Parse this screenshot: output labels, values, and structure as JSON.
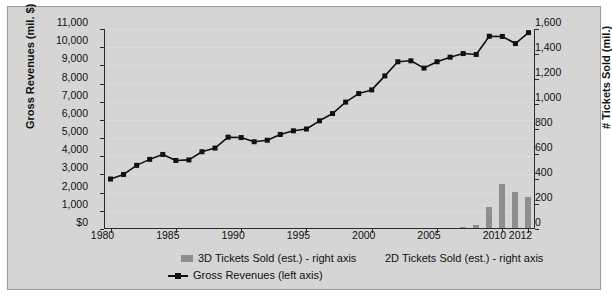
{
  "chart_data": {
    "type": "line",
    "title": "",
    "subtitle": "",
    "xlabel": "",
    "ylabel": "Gross Revenues (mil. $)",
    "y2label": "# Tickets Sold (mil.)",
    "grid": true,
    "legend_position": "bottom",
    "x": [
      1980,
      1981,
      1982,
      1983,
      1984,
      1985,
      1986,
      1987,
      1988,
      1989,
      1990,
      1991,
      1992,
      1993,
      1994,
      1995,
      1996,
      1997,
      1998,
      1999,
      2000,
      2001,
      2002,
      2003,
      2004,
      2005,
      2006,
      2007,
      2008,
      2009,
      2010,
      2011,
      2012
    ],
    "xlim": [
      1979.5,
      2012.5
    ],
    "xticks": [
      1980,
      1985,
      1990,
      1995,
      2000,
      2005,
      2010,
      2012
    ],
    "xticklabels": [
      "1980",
      "1985",
      "1990",
      "1995",
      "2000",
      "2005",
      "2010",
      "2012"
    ],
    "ylim": [
      0,
      11000
    ],
    "yticks": [
      0,
      1000,
      2000,
      3000,
      4000,
      5000,
      6000,
      7000,
      8000,
      9000,
      10000,
      11000
    ],
    "yticklabels": [
      "$0",
      "1,000",
      "2,000",
      "3,000",
      "4,000",
      "5,000",
      "6,000",
      "7,000",
      "8,000",
      "9,000",
      "10,000",
      "11,000"
    ],
    "y2lim": [
      0,
      1600
    ],
    "y2ticks": [
      0,
      200,
      400,
      600,
      800,
      1000,
      1200,
      1400,
      1600
    ],
    "y2ticklabels": [
      "0",
      "200",
      "400",
      "600",
      "800",
      "1,000",
      "1,200",
      "1,400",
      "1,600"
    ],
    "series": [
      {
        "name": "Gross Revenues (left axis)",
        "type": "line",
        "axis": "left",
        "color": "#111111",
        "marker": "square",
        "values": [
          2750,
          3000,
          3500,
          3830,
          4100,
          3770,
          3800,
          4250,
          4450,
          5050,
          5030,
          4800,
          4880,
          5200,
          5400,
          5500,
          5950,
          6350,
          6980,
          7450,
          7650,
          8420,
          9200,
          9250,
          8850,
          9200,
          9450,
          9650,
          9600,
          10600,
          10590,
          10200,
          10800
        ]
      },
      {
        "name": "3D Tickets Sold (est.) - right axis",
        "type": "bar",
        "axis": "right",
        "color": "#8e8e8e",
        "x": [
          2007,
          2008,
          2009,
          2010,
          2011,
          2012
        ],
        "values": [
          20,
          35,
          175,
          360,
          295,
          260
        ]
      },
      {
        "name": "2D Tickets Sold (est.) - right axis",
        "type": "bar",
        "axis": "right",
        "color": "#8e8e8e",
        "x": [],
        "values": []
      }
    ]
  },
  "legend": {
    "entries": [
      {
        "label": "3D Tickets Sold (est.) - right axis",
        "swatch": "bar-swatch"
      },
      {
        "label": "2D Tickets Sold (est.) - right axis",
        "swatch": "no-swatch"
      },
      {
        "label": "Gross Revenues (left axis)",
        "swatch": "line-marker-swatch"
      }
    ]
  },
  "colors": {
    "panel_background": "#d5d5d5",
    "panel_border": "#9a9a9a",
    "figure_background": "#ffffff",
    "line_series": "#111111",
    "bar_series": "#8e8e8e",
    "axis": "#2b2b2b",
    "gridline": "#e2e2e2",
    "text": "#111111"
  }
}
